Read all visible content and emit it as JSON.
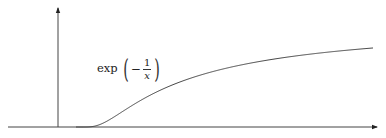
{
  "figure": {
    "label": {
      "function_name": "exp",
      "open_paren": "(",
      "sign": "−",
      "numerator": "1",
      "denominator": "x",
      "close_paren": ")"
    },
    "colors": {
      "axis": "#333333",
      "curve": "#444444",
      "background": "#ffffff"
    }
  },
  "chart_data": {
    "type": "line",
    "title": "",
    "xlabel": "",
    "ylabel": "",
    "grid": false,
    "legend": null,
    "annotations": [
      "exp(−1/x)"
    ],
    "series": [
      {
        "name": "exp(-1/x)",
        "function": "exp(-1/x)",
        "x": [
          0,
          0.25,
          0.5,
          0.75,
          1.0,
          1.5,
          2.0,
          2.5,
          3.0,
          3.29
        ],
        "y": [
          0,
          0.018,
          0.135,
          0.264,
          0.368,
          0.513,
          0.607,
          0.67,
          0.717,
          0.738
        ]
      }
    ],
    "xlim": [
      -0.56,
      3.3
    ],
    "ylim": [
      0,
      1.1
    ]
  }
}
